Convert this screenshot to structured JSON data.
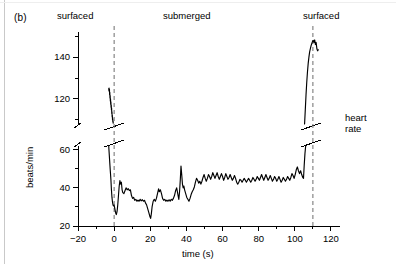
{
  "figure": {
    "panel_label": "(b)",
    "side_label_line1": "heart",
    "side_label_line2": "rate"
  },
  "chart_data": {
    "type": "line",
    "title": "",
    "subtitle": "",
    "xlabel": "time (s)",
    "ylabel": "beats/min",
    "xlim": [
      -20,
      125
    ],
    "xticks": [
      -20,
      0,
      20,
      40,
      60,
      80,
      100,
      120
    ],
    "xtick_labels": [
      "−20",
      "0",
      "20",
      "40",
      "60",
      "80",
      "100",
      "120"
    ],
    "xminor_step": 10,
    "grid": false,
    "legend": "none",
    "axis_break": {
      "present": true,
      "axis": "y",
      "lower_range": [
        20,
        62
      ],
      "upper_range": [
        108,
        152
      ],
      "lower_ticks": [
        20,
        40,
        60
      ],
      "lower_tick_labels": [
        "20",
        "40",
        "60"
      ],
      "lower_minor_ticks": [
        30,
        50
      ],
      "upper_ticks": [
        120,
        140
      ],
      "upper_tick_labels": [
        "120",
        "140"
      ],
      "upper_minor_ticks": [
        110,
        130,
        150
      ]
    },
    "annotations": [
      {
        "name": "surfaced-left",
        "text": "surfaced",
        "x": -8
      },
      {
        "name": "submerged",
        "text": "submerged",
        "x": 50
      },
      {
        "name": "surfaced-right",
        "text": "surfaced",
        "x": 112
      }
    ],
    "event_markers": [
      {
        "name": "dive-start",
        "x": 0,
        "style": "dashed-vertical"
      },
      {
        "name": "dive-end",
        "x": 110,
        "style": "dashed-vertical"
      }
    ],
    "series": [
      {
        "name": "heart rate (pre-dive, surfaced)",
        "segment": "upper-left",
        "points": [
          [
            -3.0,
            125.0
          ],
          [
            -2.9,
            124.0
          ],
          [
            -2.8,
            125.2
          ],
          [
            -2.7,
            123.5
          ],
          [
            -2.6,
            124.6
          ],
          [
            -2.5,
            122.0
          ],
          [
            -2.4,
            123.2
          ],
          [
            -2.3,
            120.5
          ],
          [
            -2.2,
            121.6
          ],
          [
            -2.1,
            119.0
          ],
          [
            -2.0,
            120.0
          ],
          [
            -1.9,
            117.5
          ],
          [
            -1.8,
            118.6
          ],
          [
            -1.7,
            116.0
          ],
          [
            -1.6,
            117.0
          ],
          [
            -1.5,
            114.8
          ],
          [
            -1.4,
            115.6
          ],
          [
            -1.3,
            113.0
          ],
          [
            -1.2,
            113.8
          ],
          [
            -1.1,
            111.5
          ],
          [
            -1.0,
            112.2
          ],
          [
            -0.9,
            110.0
          ],
          [
            -0.8,
            110.6
          ],
          [
            -0.7,
            109.0
          ],
          [
            -0.6,
            109.4
          ],
          [
            -0.5,
            108.4
          ]
        ]
      },
      {
        "name": "heart rate (dive, submerged)",
        "segment": "lower-main",
        "points": [
          [
            -3.0,
            62.0
          ],
          [
            -2.6,
            56.0
          ],
          [
            -2.2,
            50.0
          ],
          [
            -1.8,
            44.5
          ],
          [
            -1.5,
            39.0
          ],
          [
            -1.2,
            35.0
          ],
          [
            -0.9,
            32.5
          ],
          [
            -0.6,
            31.0
          ],
          [
            -0.3,
            30.6
          ],
          [
            0.0,
            31.0
          ],
          [
            0.4,
            29.0
          ],
          [
            0.8,
            27.0
          ],
          [
            1.2,
            26.0
          ],
          [
            1.6,
            27.5
          ],
          [
            2.0,
            31.0
          ],
          [
            2.4,
            36.0
          ],
          [
            2.8,
            41.0
          ],
          [
            3.2,
            43.8
          ],
          [
            3.6,
            42.0
          ],
          [
            4.0,
            43.0
          ],
          [
            4.4,
            39.0
          ],
          [
            4.8,
            37.5
          ],
          [
            5.4,
            37.0
          ],
          [
            6.0,
            38.5
          ],
          [
            6.6,
            40.0
          ],
          [
            7.2,
            39.0
          ],
          [
            7.8,
            39.6
          ],
          [
            8.4,
            38.6
          ],
          [
            9.0,
            39.0
          ],
          [
            9.6,
            36.0
          ],
          [
            10.2,
            34.5
          ],
          [
            10.8,
            35.0
          ],
          [
            11.4,
            33.5
          ],
          [
            12.0,
            34.0
          ],
          [
            12.6,
            33.0
          ],
          [
            13.2,
            33.6
          ],
          [
            13.8,
            33.0
          ],
          [
            14.4,
            34.0
          ],
          [
            15.0,
            33.2
          ],
          [
            15.6,
            33.8
          ],
          [
            16.2,
            33.0
          ],
          [
            16.8,
            33.5
          ],
          [
            17.4,
            32.0
          ],
          [
            18.0,
            31.0
          ],
          [
            18.6,
            29.0
          ],
          [
            19.2,
            27.0
          ],
          [
            19.8,
            25.0
          ],
          [
            20.2,
            24.0
          ],
          [
            20.6,
            26.5
          ],
          [
            21.0,
            30.0
          ],
          [
            21.6,
            33.0
          ],
          [
            22.2,
            34.0
          ],
          [
            22.8,
            33.0
          ],
          [
            23.4,
            34.5
          ],
          [
            24.0,
            37.0
          ],
          [
            24.6,
            39.5
          ],
          [
            25.0,
            38.0
          ],
          [
            25.6,
            39.0
          ],
          [
            26.2,
            37.0
          ],
          [
            26.8,
            34.5
          ],
          [
            27.4,
            33.5
          ],
          [
            28.0,
            34.0
          ],
          [
            28.6,
            33.0
          ],
          [
            29.2,
            33.6
          ],
          [
            29.8,
            33.0
          ],
          [
            30.4,
            33.8
          ],
          [
            31.0,
            33.0
          ],
          [
            31.6,
            34.0
          ],
          [
            32.2,
            33.5
          ],
          [
            32.8,
            34.5
          ],
          [
            33.4,
            36.0
          ],
          [
            34.0,
            38.5
          ],
          [
            34.6,
            40.0
          ],
          [
            35.0,
            38.0
          ],
          [
            35.4,
            36.0
          ],
          [
            35.8,
            34.0
          ],
          [
            36.2,
            38.0
          ],
          [
            36.6,
            44.0
          ],
          [
            37.0,
            51.5
          ],
          [
            37.4,
            47.0
          ],
          [
            37.8,
            42.0
          ],
          [
            38.2,
            40.0
          ],
          [
            38.6,
            41.0
          ],
          [
            39.0,
            39.0
          ],
          [
            39.6,
            37.0
          ],
          [
            40.2,
            35.0
          ],
          [
            40.8,
            34.0
          ],
          [
            41.4,
            33.0
          ],
          [
            42.0,
            34.5
          ],
          [
            42.6,
            36.5
          ],
          [
            43.2,
            38.0
          ],
          [
            43.8,
            39.0
          ],
          [
            44.4,
            40.5
          ],
          [
            45.0,
            43.0
          ],
          [
            45.6,
            45.0
          ],
          [
            46.2,
            44.0
          ],
          [
            46.8,
            42.5
          ],
          [
            47.4,
            43.5
          ],
          [
            48.0,
            42.0
          ],
          [
            48.6,
            43.5
          ],
          [
            49.2,
            45.5
          ],
          [
            49.8,
            47.0
          ],
          [
            50.4,
            45.0
          ],
          [
            51.0,
            43.5
          ],
          [
            51.6,
            45.0
          ],
          [
            52.2,
            47.0
          ],
          [
            52.8,
            46.0
          ],
          [
            53.4,
            44.5
          ],
          [
            54.0,
            46.0
          ],
          [
            54.6,
            48.0
          ],
          [
            55.2,
            46.5
          ],
          [
            55.8,
            45.0
          ],
          [
            56.4,
            46.5
          ],
          [
            57.0,
            48.0
          ],
          [
            57.6,
            46.0
          ],
          [
            58.2,
            44.5
          ],
          [
            58.8,
            46.0
          ],
          [
            59.4,
            47.5
          ],
          [
            60.0,
            46.0
          ],
          [
            60.6,
            44.0
          ],
          [
            61.2,
            45.5
          ],
          [
            61.8,
            47.5
          ],
          [
            62.4,
            46.0
          ],
          [
            63.0,
            44.5
          ],
          [
            63.6,
            45.5
          ],
          [
            64.2,
            47.0
          ],
          [
            64.8,
            45.5
          ],
          [
            65.4,
            44.0
          ],
          [
            66.0,
            45.0
          ],
          [
            66.6,
            46.5
          ],
          [
            67.2,
            45.0
          ],
          [
            67.8,
            43.0
          ],
          [
            68.4,
            42.0
          ],
          [
            69.0,
            43.0
          ],
          [
            69.6,
            44.5
          ],
          [
            70.2,
            44.0
          ],
          [
            70.8,
            43.0
          ],
          [
            71.4,
            44.0
          ],
          [
            72.0,
            45.0
          ],
          [
            72.6,
            44.0
          ],
          [
            73.2,
            43.0
          ],
          [
            73.8,
            44.0
          ],
          [
            74.4,
            45.0
          ],
          [
            75.0,
            44.0
          ],
          [
            75.6,
            43.0
          ],
          [
            76.2,
            44.0
          ],
          [
            76.8,
            45.5
          ],
          [
            77.4,
            44.5
          ],
          [
            78.0,
            43.5
          ],
          [
            78.6,
            44.5
          ],
          [
            79.2,
            46.0
          ],
          [
            79.8,
            45.0
          ],
          [
            80.4,
            44.0
          ],
          [
            81.0,
            45.5
          ],
          [
            81.6,
            47.0
          ],
          [
            82.2,
            45.5
          ],
          [
            82.8,
            44.0
          ],
          [
            83.4,
            45.5
          ],
          [
            84.0,
            47.0
          ],
          [
            84.6,
            45.5
          ],
          [
            85.2,
            44.0
          ],
          [
            85.8,
            45.0
          ],
          [
            86.4,
            46.5
          ],
          [
            87.0,
            45.0
          ],
          [
            87.6,
            43.5
          ],
          [
            88.2,
            44.5
          ],
          [
            88.8,
            46.0
          ],
          [
            89.4,
            45.0
          ],
          [
            90.0,
            43.5
          ],
          [
            90.6,
            44.5
          ],
          [
            91.2,
            46.0
          ],
          [
            91.8,
            44.5
          ],
          [
            92.4,
            43.0
          ],
          [
            93.0,
            44.0
          ],
          [
            93.6,
            45.5
          ],
          [
            94.2,
            44.5
          ],
          [
            94.8,
            43.5
          ],
          [
            95.4,
            44.5
          ],
          [
            96.0,
            46.0
          ],
          [
            96.6,
            45.0
          ],
          [
            97.2,
            44.0
          ],
          [
            97.8,
            45.5
          ],
          [
            98.4,
            47.5
          ],
          [
            99.0,
            46.5
          ],
          [
            99.6,
            45.0
          ],
          [
            100.2,
            47.0
          ],
          [
            100.8,
            49.5
          ],
          [
            101.4,
            51.0
          ],
          [
            102.0,
            49.0
          ],
          [
            102.6,
            47.5
          ],
          [
            103.2,
            49.0
          ],
          [
            103.8,
            47.0
          ],
          [
            104.4,
            45.5
          ],
          [
            104.8,
            45.0
          ],
          [
            105.2,
            52.0
          ],
          [
            105.6,
            58.0
          ],
          [
            106.0,
            62.0
          ]
        ]
      },
      {
        "name": "heart rate (post-dive, surfaced)",
        "segment": "upper-right",
        "points": [
          [
            105.4,
            108.0
          ],
          [
            105.8,
            115.0
          ],
          [
            106.2,
            122.0
          ],
          [
            106.6,
            128.0
          ],
          [
            107.0,
            133.0
          ],
          [
            107.4,
            137.0
          ],
          [
            107.8,
            140.0
          ],
          [
            108.2,
            142.5
          ],
          [
            108.6,
            144.0
          ],
          [
            109.0,
            145.5
          ],
          [
            109.4,
            146.5
          ],
          [
            109.8,
            147.5
          ],
          [
            110.2,
            148.0
          ],
          [
            110.6,
            147.0
          ],
          [
            111.0,
            148.2
          ],
          [
            111.4,
            146.0
          ],
          [
            111.8,
            147.0
          ],
          [
            112.2,
            144.0
          ],
          [
            112.6,
            143.0
          ],
          [
            113.0,
            143.5
          ]
        ]
      }
    ]
  }
}
